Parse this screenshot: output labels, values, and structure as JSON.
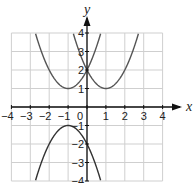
{
  "chart_data": {
    "type": "line",
    "title": "",
    "xlabel": "x",
    "ylabel": "y",
    "xlim": [
      -4,
      4
    ],
    "ylim": [
      -4,
      4
    ],
    "grid": true,
    "x_ticks": [
      -4,
      -3,
      -2,
      -1,
      0,
      1,
      2,
      3,
      4
    ],
    "y_ticks": [
      -4,
      -3,
      -2,
      -1,
      1,
      2,
      3,
      4
    ],
    "origin_label": "0",
    "series": [
      {
        "name": "y = (x+1)^2 + 1",
        "vertex": [
          -1,
          1
        ],
        "a": 1,
        "h": -1,
        "k": 1,
        "color": "#555555"
      },
      {
        "name": "y = (x-1)^2 + 1",
        "vertex": [
          1,
          1
        ],
        "a": 1,
        "h": 1,
        "k": 1,
        "color": "#555555"
      },
      {
        "name": "y = -(x+1)^2 - 1",
        "vertex": [
          -1,
          -1
        ],
        "a": -1,
        "h": -1,
        "k": -1,
        "color": "#333333"
      }
    ]
  },
  "colors": {
    "grid": "#cfcfcf",
    "axis": "#111111",
    "curve": "#555555"
  }
}
